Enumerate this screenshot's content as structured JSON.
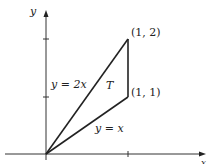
{
  "figure": {
    "top_text_cropped": "∫₀ ∫ₓ",
    "axes": {
      "x_label": "x",
      "y_label": "y"
    },
    "points": [
      {
        "label": "(1, 2)",
        "x": 1,
        "y": 2
      },
      {
        "label": "(1, 1)",
        "x": 1,
        "y": 1
      },
      {
        "label": "",
        "x": 0,
        "y": 0
      }
    ],
    "lines": [
      {
        "label": "y = 2x"
      },
      {
        "label": "y = x"
      }
    ],
    "region_label": "T",
    "colors": {
      "stroke": "#222222",
      "background": "#ffffff"
    }
  }
}
